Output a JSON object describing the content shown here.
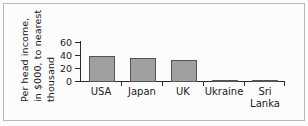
{
  "chart_data": {
    "type": "bar",
    "title": "",
    "xlabel": "",
    "ylabel": "Per head income, in $000, to nearest thousand",
    "ylabel_lines": [
      "Per head income,",
      "in $000, to nearest",
      "thousand"
    ],
    "categories": [
      "USA",
      "Japan",
      "UK",
      "Ukraine",
      "Sri Lanka"
    ],
    "category_lines": [
      [
        "USA"
      ],
      [
        "Japan"
      ],
      [
        "UK"
      ],
      [
        "Ukraine"
      ],
      [
        "Sri",
        "Lanka"
      ]
    ],
    "values": [
      42,
      38,
      35,
      1,
      1
    ],
    "ylim": [
      0,
      65
    ],
    "yticks": [
      0,
      20,
      40,
      60
    ],
    "ytick_labels": [
      "0",
      "20",
      "40",
      "60"
    ],
    "grid": false,
    "legend": false,
    "bar_color": "#a0a0a0",
    "bar_edge_color": "#555555",
    "axis_color": "#2a2a2a",
    "background_color": "#fcfcfc"
  }
}
